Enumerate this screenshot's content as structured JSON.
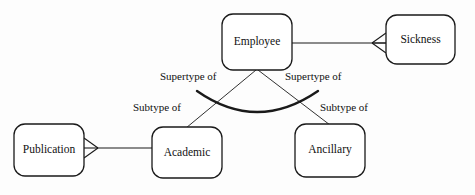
{
  "diagram": {
    "stroke_color": "#1a1a1a",
    "fill_color": "#ffffff",
    "background_color": "#fdfdfd",
    "entities": [
      {
        "id": "employee",
        "label": "Employee",
        "x": 222,
        "y": 14,
        "width": 70,
        "height": 56,
        "radius": 11
      },
      {
        "id": "sickness",
        "label": "Sickness",
        "x": 386,
        "y": 15,
        "width": 69,
        "height": 49,
        "radius": 11
      },
      {
        "id": "publication",
        "label": "Publication",
        "x": 14,
        "y": 124,
        "width": 70,
        "height": 52,
        "radius": 11
      },
      {
        "id": "academic",
        "label": "Academic",
        "x": 152,
        "y": 127,
        "width": 70,
        "height": 51,
        "radius": 11
      },
      {
        "id": "ancillary",
        "label": "Ancillary",
        "x": 295,
        "y": 124,
        "width": 70,
        "height": 53,
        "radius": 11
      }
    ],
    "relationship_labels": [
      {
        "id": "supertype-of-left",
        "label": "Supertype of",
        "x": 160,
        "y": 71
      },
      {
        "id": "supertype-of-right",
        "label": "Supertype of",
        "x": 285,
        "y": 71
      },
      {
        "id": "subtype-of-left",
        "label": "Subtype of",
        "x": 133,
        "y": 102
      },
      {
        "id": "subtype-of-right",
        "label": "Subtype of",
        "x": 320,
        "y": 102
      }
    ],
    "connectors": [
      {
        "id": "employee-sickness",
        "from": "employee",
        "to": "sickness",
        "kind": "straight",
        "crowsfoot_at": "to-left"
      },
      {
        "id": "publication-academic",
        "from": "publication",
        "to": "academic",
        "kind": "straight",
        "crowsfoot_at": "from-right"
      },
      {
        "id": "employee-academic",
        "from": "employee",
        "to": "academic",
        "kind": "diagonal"
      },
      {
        "id": "employee-ancillary",
        "from": "employee",
        "to": "ancillary",
        "kind": "diagonal"
      },
      {
        "id": "subtype-arc",
        "kind": "arc",
        "note": "thick arc spanning the two subtype lines"
      }
    ]
  }
}
